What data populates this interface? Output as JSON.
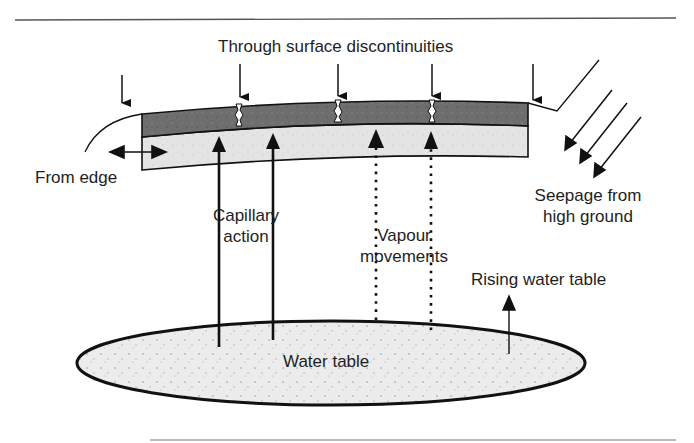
{
  "diagram": {
    "title_label": "Through surface discontinuities",
    "labels": {
      "from_edge": "From edge",
      "capillary_line1": "Capillary",
      "capillary_line2": "action",
      "vapour_line1": "Vapour",
      "vapour_line2": "movements",
      "seepage_line1": "Seepage from",
      "seepage_line2": "high ground",
      "rising": "Rising water table",
      "water_table": "Water table"
    },
    "colors": {
      "surface_layer": "#6b6b6b",
      "base_layer": "#e2e2e2",
      "water_table_fill": "#ececec",
      "stroke": "#111111",
      "rule": "#555555"
    },
    "moisture_sources": [
      "Through surface discontinuities",
      "From edge",
      "Capillary action",
      "Vapour movements",
      "Seepage from high ground",
      "Rising water table"
    ]
  }
}
